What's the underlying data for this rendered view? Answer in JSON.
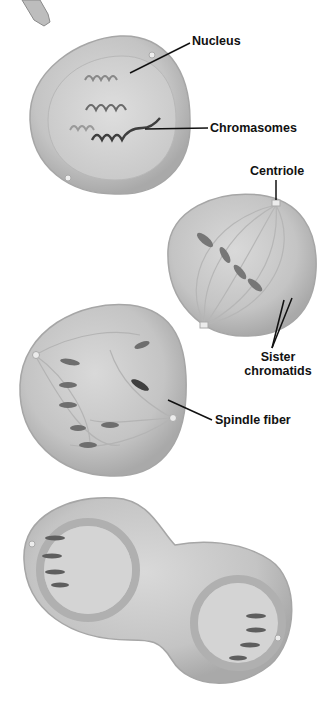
{
  "diagram": {
    "labels": {
      "nucleus": "Nucleus",
      "chromasomes": "Chromasomes",
      "centriole": "Centriole",
      "sister_line1": "Sister",
      "sister_line2": "chromatids",
      "spindle_fiber": "Spindle fiber"
    },
    "stages": [
      {
        "id": "prophase",
        "labels": [
          "Nucleus",
          "Chromasomes"
        ]
      },
      {
        "id": "metaphase",
        "labels": [
          "Centriole",
          "Sister chromatids"
        ]
      },
      {
        "id": "anaphase",
        "labels": [
          "Spindle fiber"
        ]
      },
      {
        "id": "telophase",
        "labels": []
      }
    ],
    "colors": {
      "cell_fill": "#c9c9c9",
      "cell_rim": "#a8a8a8",
      "nucleus_fill": "#d6d6d6",
      "chromosome_dark": "#444444",
      "chromosome_mid": "#7a7a7a",
      "leader_line": "#111111"
    }
  }
}
